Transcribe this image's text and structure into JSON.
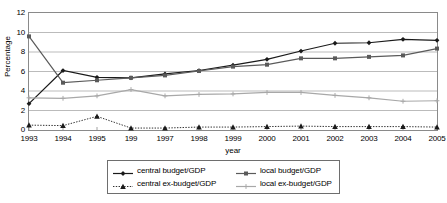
{
  "chart_data": {
    "type": "line",
    "title": "",
    "xlabel": "year",
    "ylabel": "Percentage",
    "ylim": [
      0,
      12
    ],
    "yticks": [
      0,
      2,
      4,
      6,
      8,
      10,
      12
    ],
    "grid": true,
    "legend_position": "bottom",
    "categories": [
      "1993",
      "1994",
      "1995",
      "199",
      "1997",
      "1998",
      "1999",
      "2000",
      "2001",
      "2002",
      "2003",
      "2004",
      "2005"
    ],
    "series": [
      {
        "name": "central budget/GDP",
        "marker": "diamond",
        "color": "#1a1a1a",
        "line_style": "solid",
        "values": [
          2.7,
          6.1,
          5.4,
          5.35,
          5.75,
          6.1,
          6.65,
          7.25,
          8.1,
          8.9,
          8.95,
          9.3,
          9.2
        ]
      },
      {
        "name": "local budget/GDP",
        "marker": "square",
        "color": "#5a5a5a",
        "line_style": "solid",
        "values": [
          9.6,
          4.85,
          5.1,
          5.35,
          5.6,
          6.05,
          6.5,
          6.7,
          7.35,
          7.35,
          7.5,
          7.65,
          8.35
        ]
      },
      {
        "name": "central ex-budget/GDP",
        "marker": "triangle",
        "color": "#1a1a1a",
        "line_style": "dotted",
        "values": [
          0.5,
          0.45,
          1.4,
          0.2,
          0.2,
          0.3,
          0.3,
          0.35,
          0.4,
          0.35,
          0.35,
          0.35,
          0.3
        ]
      },
      {
        "name": "local ex-budget/GDP",
        "marker": "cross",
        "color": "#a8a8a8",
        "line_style": "solid",
        "values": [
          3.3,
          3.25,
          3.5,
          4.15,
          3.5,
          3.65,
          3.7,
          3.85,
          3.85,
          3.55,
          3.3,
          2.95,
          3.0
        ]
      }
    ]
  },
  "axes": {
    "y_title": "Percentage",
    "x_title": "year"
  },
  "legend": {
    "items": [
      {
        "label": "central budget/GDP",
        "marker": "diamond-marker",
        "color": "#1a1a1a",
        "dash": "solid"
      },
      {
        "label": "local budget/GDP",
        "marker": "square-marker",
        "color": "#5a5a5a",
        "dash": "solid"
      },
      {
        "label": "central ex-budget/GDP",
        "marker": "triangle-marker",
        "color": "#1a1a1a",
        "dash": "dotted"
      },
      {
        "label": "local ex-budget/GDP",
        "marker": "cross-marker",
        "color": "#a8a8a8",
        "dash": "solid"
      }
    ]
  }
}
